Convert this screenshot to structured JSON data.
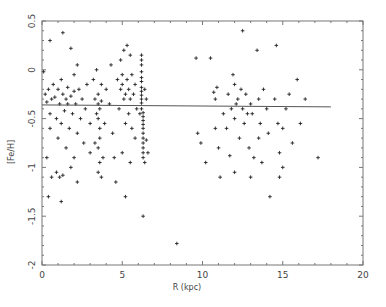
{
  "chart_data": {
    "type": "scatter",
    "title": "",
    "xlabel": "R (kpc)",
    "ylabel": "[Fe/H]",
    "xlim": [
      0,
      20
    ],
    "ylim": [
      -2,
      0.5
    ],
    "xticks": [
      0,
      5,
      10,
      15,
      20
    ],
    "xtick_labels": [
      "0",
      "5",
      "10",
      "15",
      "20"
    ],
    "yticks": [
      -2,
      -1.5,
      -1,
      -0.5,
      0,
      0.5
    ],
    "ytick_labels": [
      "-2",
      "-1.5",
      "-1",
      "-0.5",
      "0",
      "0.5"
    ],
    "grid": false,
    "legend": null,
    "marker": "+",
    "fit_line": {
      "x": [
        0,
        18
      ],
      "y": [
        -0.36,
        -0.38
      ]
    },
    "series": [
      {
        "name": "clusters",
        "points": [
          [
            0.1,
            -0.02
          ],
          [
            0.2,
            -0.25
          ],
          [
            0.3,
            -0.33
          ],
          [
            0.4,
            -0.2
          ],
          [
            0.5,
            -0.45
          ],
          [
            0.5,
            -0.6
          ],
          [
            0.6,
            -0.3
          ],
          [
            0.7,
            -0.15
          ],
          [
            0.8,
            -0.28
          ],
          [
            0.9,
            -0.5
          ],
          [
            1.0,
            -0.2
          ],
          [
            1.0,
            -0.7
          ],
          [
            1.1,
            -0.35
          ],
          [
            1.2,
            -0.1
          ],
          [
            1.2,
            -0.55
          ],
          [
            1.3,
            -0.25
          ],
          [
            1.4,
            -0.42
          ],
          [
            1.5,
            -0.3
          ],
          [
            1.5,
            -0.8
          ],
          [
            1.6,
            -0.18
          ],
          [
            1.7,
            -0.6
          ],
          [
            1.8,
            -0.27
          ],
          [
            1.9,
            -0.45
          ],
          [
            2.0,
            -0.22
          ],
          [
            2.0,
            -0.9
          ],
          [
            2.1,
            -0.35
          ],
          [
            2.2,
            -0.65
          ],
          [
            2.3,
            -0.2
          ],
          [
            2.4,
            -0.5
          ],
          [
            2.5,
            -0.3
          ],
          [
            0.3,
            -0.9
          ],
          [
            0.6,
            -1.1
          ],
          [
            0.9,
            -1.05
          ],
          [
            1.1,
            -1.1
          ],
          [
            1.3,
            -1.08
          ],
          [
            0.4,
            -1.3
          ],
          [
            1.2,
            -1.35
          ],
          [
            1.8,
            -1.0
          ],
          [
            2.2,
            -1.15
          ],
          [
            2.6,
            -0.75
          ],
          [
            1.3,
            0.38
          ],
          [
            1.8,
            0.22
          ],
          [
            2.0,
            -0.05
          ],
          [
            2.2,
            0.05
          ],
          [
            0.5,
            0.3
          ],
          [
            1.6,
            -0.35
          ],
          [
            2.7,
            -0.4
          ],
          [
            2.8,
            -0.15
          ],
          [
            3.0,
            -0.55
          ],
          [
            3.0,
            -0.85
          ],
          [
            3.2,
            -0.1
          ],
          [
            3.3,
            -0.3
          ],
          [
            3.4,
            -0.45
          ],
          [
            3.5,
            -0.25
          ],
          [
            3.5,
            -0.35
          ],
          [
            3.5,
            -0.5
          ],
          [
            3.6,
            -0.6
          ],
          [
            3.6,
            -0.7
          ],
          [
            3.5,
            -0.8
          ],
          [
            3.6,
            -0.95
          ],
          [
            3.7,
            -0.32
          ],
          [
            3.6,
            -0.4
          ],
          [
            3.7,
            -0.15
          ],
          [
            3.4,
            0.0
          ],
          [
            3.5,
            -1.05
          ],
          [
            3.7,
            -1.1
          ],
          [
            3.8,
            -0.9
          ],
          [
            3.3,
            -0.75
          ],
          [
            3.9,
            -0.55
          ],
          [
            4.0,
            -0.2
          ],
          [
            4.2,
            -0.35
          ],
          [
            4.3,
            0.05
          ],
          [
            4.4,
            -0.65
          ],
          [
            4.5,
            -0.9
          ],
          [
            4.6,
            -1.15
          ],
          [
            4.7,
            -0.1
          ],
          [
            4.8,
            -0.4
          ],
          [
            4.9,
            -0.2
          ],
          [
            4.9,
            0.1
          ],
          [
            5.0,
            -0.15
          ],
          [
            5.0,
            -0.05
          ],
          [
            5.1,
            -0.3
          ],
          [
            5.1,
            0.2
          ],
          [
            5.2,
            -0.25
          ],
          [
            5.2,
            -0.55
          ],
          [
            5.3,
            -0.1
          ],
          [
            5.3,
            0.25
          ],
          [
            5.4,
            -0.2
          ],
          [
            5.4,
            -0.45
          ],
          [
            5.5,
            0.15
          ],
          [
            5.5,
            -0.3
          ],
          [
            5.6,
            -0.05
          ],
          [
            5.6,
            -0.6
          ],
          [
            5.7,
            -0.25
          ],
          [
            5.8,
            -0.15
          ],
          [
            5.9,
            -0.4
          ],
          [
            5.0,
            -0.85
          ],
          [
            5.2,
            -1.3
          ],
          [
            5.5,
            -0.95
          ],
          [
            5.8,
            -0.7
          ],
          [
            6.2,
            0.05
          ],
          [
            6.2,
            -0.02
          ],
          [
            6.2,
            -0.08
          ],
          [
            6.2,
            -0.12
          ],
          [
            6.2,
            -0.18
          ],
          [
            6.2,
            -0.22
          ],
          [
            6.2,
            -0.26
          ],
          [
            6.2,
            -0.3
          ],
          [
            6.2,
            -0.34
          ],
          [
            6.2,
            -0.4
          ],
          [
            6.3,
            -0.44
          ],
          [
            6.3,
            -0.48
          ],
          [
            6.3,
            -0.52
          ],
          [
            6.3,
            -0.56
          ],
          [
            6.3,
            -0.6
          ],
          [
            6.3,
            -0.65
          ],
          [
            6.3,
            -0.7
          ],
          [
            6.3,
            -0.75
          ],
          [
            6.3,
            -0.8
          ],
          [
            6.3,
            -0.85
          ],
          [
            6.2,
            0.1
          ],
          [
            6.2,
            0.15
          ],
          [
            6.3,
            -0.9
          ],
          [
            6.4,
            -0.95
          ],
          [
            6.5,
            -0.72
          ],
          [
            6.6,
            -0.85
          ],
          [
            6.3,
            -1.5
          ],
          [
            6.5,
            -0.3
          ],
          [
            6.1,
            -0.45
          ],
          [
            6.4,
            -0.2
          ],
          [
            8.4,
            -1.78
          ],
          [
            9.6,
            0.12
          ],
          [
            9.7,
            -0.65
          ],
          [
            9.9,
            -0.75
          ],
          [
            10.5,
            0.12
          ],
          [
            10.7,
            -0.23
          ],
          [
            10.9,
            -0.18
          ],
          [
            10.8,
            -0.3
          ],
          [
            10.8,
            -0.6
          ],
          [
            11.0,
            -0.8
          ],
          [
            11.3,
            -0.45
          ],
          [
            11.5,
            -0.6
          ],
          [
            11.6,
            -0.25
          ],
          [
            11.8,
            -0.4
          ],
          [
            11.9,
            -0.05
          ],
          [
            12.0,
            -0.15
          ],
          [
            12.0,
            -0.5
          ],
          [
            12.1,
            -0.35
          ],
          [
            12.2,
            -0.3
          ],
          [
            12.3,
            -0.7
          ],
          [
            12.4,
            -0.2
          ],
          [
            12.5,
            -0.4
          ],
          [
            12.5,
            0.4
          ],
          [
            12.6,
            -0.55
          ],
          [
            12.7,
            -0.25
          ],
          [
            12.8,
            -0.45
          ],
          [
            12.9,
            -0.8
          ],
          [
            13.0,
            -0.35
          ],
          [
            13.1,
            -0.45
          ],
          [
            13.2,
            -0.9
          ],
          [
            13.4,
            0.2
          ],
          [
            13.5,
            -0.3
          ],
          [
            13.5,
            -0.7
          ],
          [
            13.6,
            -0.55
          ],
          [
            13.7,
            -0.95
          ],
          [
            13.8,
            -0.2
          ],
          [
            14.0,
            -0.4
          ],
          [
            14.1,
            -0.65
          ],
          [
            14.2,
            -1.3
          ],
          [
            14.5,
            -0.3
          ],
          [
            14.6,
            0.25
          ],
          [
            14.7,
            -0.55
          ],
          [
            14.8,
            -0.85
          ],
          [
            15.0,
            -0.6
          ],
          [
            15.0,
            -1.0
          ],
          [
            15.2,
            -0.4
          ],
          [
            15.4,
            -0.25
          ],
          [
            15.6,
            -0.75
          ],
          [
            15.9,
            -0.1
          ],
          [
            16.1,
            -0.55
          ],
          [
            16.4,
            -0.3
          ],
          [
            17.2,
            -0.9
          ],
          [
            10.2,
            -0.95
          ],
          [
            11.1,
            -1.1
          ],
          [
            12.0,
            -1.05
          ],
          [
            11.7,
            -0.88
          ],
          [
            13.0,
            -1.1
          ],
          [
            14.8,
            -1.1
          ]
        ]
      }
    ]
  },
  "axes": {
    "xlabel": "R (kpc)",
    "ylabel": "[Fe/H]",
    "xtick_labels": [
      "0",
      "5",
      "10",
      "15",
      "20"
    ],
    "ytick_labels": [
      "-2",
      "-1.5",
      "-1",
      "-0.5",
      "0",
      "0.5"
    ]
  }
}
